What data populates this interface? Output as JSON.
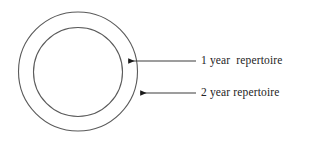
{
  "figure": {
    "type": "concentric-circles-diagram",
    "background_color": "#ffffff",
    "stroke_color": "#5a5a5a",
    "text_color": "#242424",
    "arrow_color": "#1a1a1a",
    "circles": [
      {
        "name": "outer-circle",
        "meaning": "2 year repertoire",
        "center_x": 78,
        "center_y": 71.5,
        "radius": 59.5
      },
      {
        "name": "inner-circle",
        "meaning": "1 year repertoire",
        "center_x": 78,
        "center_y": 72,
        "radius": 44.5
      }
    ],
    "annotations": [
      {
        "id": "inner",
        "label": "1 year  repertoire",
        "arrow_tip_x": 122,
        "arrow_tip_y": 61,
        "line_end_x": 196,
        "line_y": 61,
        "points_to": "inner-circle"
      },
      {
        "id": "outer",
        "label": "2 year repertoire",
        "arrow_tip_x": 134,
        "arrow_tip_y": 93,
        "line_end_x": 196,
        "line_y": 93,
        "points_to": "outer-circle"
      }
    ]
  }
}
